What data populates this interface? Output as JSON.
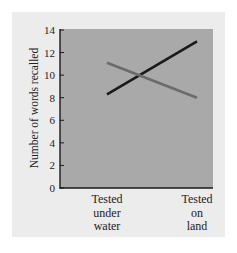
{
  "chart_data": {
    "type": "line",
    "title": "",
    "xlabel": "",
    "ylabel": "Number of words recalled",
    "categories": [
      [
        "Tested",
        "under",
        "water"
      ],
      [
        "Tested",
        "on",
        "land"
      ]
    ],
    "yticks": [
      "0",
      "2",
      "4",
      "6",
      "8",
      "10",
      "12",
      "14"
    ],
    "ylim": [
      0,
      14
    ],
    "grid": false,
    "legend": null,
    "series": [
      {
        "name": "Learned on land",
        "color": "#1a1a1a",
        "values": [
          8.3,
          13
        ]
      },
      {
        "name": "Learned under water",
        "color": "#6b6b6b",
        "values": [
          11.1,
          8
        ]
      }
    ],
    "colors": {
      "panel_bg": "#ececec",
      "plot_bg": "#a9a9a9",
      "axis": "#1a1a1a"
    }
  }
}
